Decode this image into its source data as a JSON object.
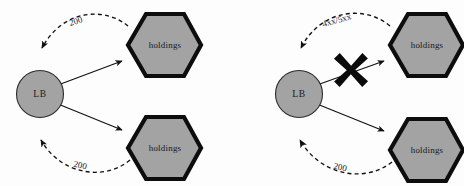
{
  "figure": {
    "background_color": "#fdfdfd",
    "node_fill_color": "#a3a3a3",
    "node_stroke_color": "#0d0d0d",
    "edge_color": "#111111",
    "panels": [
      {
        "id": "left-panel",
        "name": "healthy-traffic-diagram",
        "balancer": {
          "label": "LB"
        },
        "backends": [
          {
            "label": "holdings",
            "position": "top"
          },
          {
            "label": "holdings",
            "position": "bottom"
          }
        ],
        "response_labels": [
          {
            "text": "200",
            "position": "top"
          },
          {
            "text": "200",
            "position": "bottom"
          }
        ],
        "blocked": false
      },
      {
        "id": "right-panel",
        "name": "error-response-diagram",
        "balancer": {
          "label": "LB"
        },
        "backends": [
          {
            "label": "holdings",
            "position": "top"
          },
          {
            "label": "holdings",
            "position": "bottom"
          }
        ],
        "response_labels": [
          {
            "text": "4xx/5xx",
            "position": "top"
          },
          {
            "text": "200",
            "position": "bottom"
          }
        ],
        "blocked": true,
        "block_marker": "x-cross"
      }
    ]
  }
}
